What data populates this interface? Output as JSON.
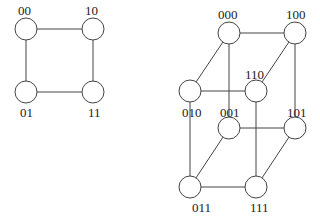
{
  "diagram": {
    "node_radius": 11,
    "graphs": [
      {
        "name": "2-cube",
        "nodes": [
          {
            "id": "00",
            "label": "00",
            "x": 26,
            "y": 29,
            "lx": 18,
            "ly": 15
          },
          {
            "id": "10",
            "label": "10",
            "x": 93,
            "y": 29,
            "lx": 85,
            "ly": 15
          },
          {
            "id": "01",
            "label": "01",
            "x": 26,
            "y": 92,
            "lx": 20,
            "ly": 117
          },
          {
            "id": "11",
            "label": "11",
            "x": 93,
            "y": 92,
            "lx": 88,
            "ly": 117
          }
        ],
        "edges": [
          [
            "00",
            "10"
          ],
          [
            "00",
            "01"
          ],
          [
            "10",
            "11"
          ],
          [
            "01",
            "11"
          ]
        ]
      },
      {
        "name": "3-cube",
        "nodes": [
          {
            "id": "000",
            "label": "000",
            "x": 229,
            "y": 33,
            "lx": 218,
            "ly": 19
          },
          {
            "id": "100",
            "label": "100",
            "x": 295,
            "y": 33,
            "lx": 286,
            "ly": 19
          },
          {
            "id": "010",
            "label": "010",
            "x": 190,
            "y": 91,
            "lx": 182,
            "ly": 117
          },
          {
            "id": "110",
            "label": "110",
            "x": 256,
            "y": 91,
            "lx": 245,
            "ly": 79
          },
          {
            "id": "001",
            "label": "001",
            "x": 229,
            "y": 128,
            "lx": 220,
            "ly": 117
          },
          {
            "id": "101",
            "label": "101",
            "x": 295,
            "y": 128,
            "lx": 287,
            "ly": 117
          },
          {
            "id": "011",
            "label": "011",
            "x": 190,
            "y": 187,
            "lx": 192,
            "ly": 212
          },
          {
            "id": "111",
            "label": "111",
            "x": 256,
            "y": 187,
            "lx": 250,
            "ly": 212
          }
        ],
        "edges": [
          [
            "000",
            "100"
          ],
          [
            "000",
            "010"
          ],
          [
            "000",
            "001"
          ],
          [
            "100",
            "110"
          ],
          [
            "100",
            "101"
          ],
          [
            "010",
            "110"
          ],
          [
            "010",
            "011"
          ],
          [
            "110",
            "111"
          ],
          [
            "001",
            "101"
          ],
          [
            "001",
            "011"
          ],
          [
            "101",
            "111"
          ],
          [
            "011",
            "111"
          ]
        ]
      }
    ]
  }
}
